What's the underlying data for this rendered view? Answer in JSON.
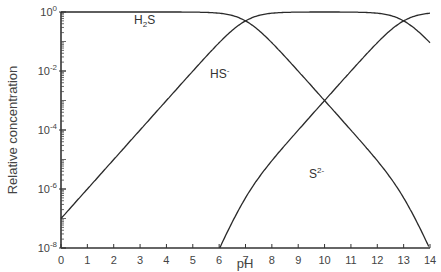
{
  "chart_data": {
    "type": "line",
    "title": "",
    "xlabel": "pH",
    "ylabel": "Relative concentration",
    "xlim": [
      0,
      14
    ],
    "ylim_log10": [
      -8,
      0
    ],
    "yscale": "log",
    "grid": false,
    "legend": "inline labels",
    "x_ticks": [
      "0",
      "1",
      "2",
      "3",
      "4",
      "5",
      "6",
      "7",
      "8",
      "9",
      "10",
      "11",
      "12",
      "13",
      "14"
    ],
    "y_ticks": [
      {
        "base": "10",
        "exp": "0",
        "log": 0
      },
      {
        "base": "10",
        "exp": "-2",
        "log": -2
      },
      {
        "base": "10",
        "exp": "-4",
        "log": -4
      },
      {
        "base": "10",
        "exp": "-6",
        "log": -6
      },
      {
        "base": "10",
        "exp": "-8",
        "log": -8
      }
    ],
    "pKa1": 7,
    "pKa2": 13,
    "series": [
      {
        "name": "H2S",
        "label_main": "H",
        "label_sub": "2",
        "label_end": "S",
        "label_sup": "",
        "x": [
          0,
          1,
          2,
          3,
          4,
          5,
          6,
          7,
          8,
          9,
          10,
          11,
          12,
          13,
          14
        ],
        "log10_values": [
          0,
          0,
          0,
          0,
          0,
          -0.04,
          -0.3,
          -1.0,
          -2.0,
          -3.0,
          -4.0,
          -5.0,
          -6.0,
          -7.0,
          -7.8
        ]
      },
      {
        "name": "HS-",
        "label_main": "HS",
        "label_sub": "",
        "label_end": "",
        "label_sup": "-",
        "x": [
          0,
          1,
          2,
          3,
          4,
          5,
          6,
          7,
          8,
          9,
          10,
          11,
          12,
          13,
          14
        ],
        "log10_values": [
          -7.0,
          -6.0,
          -5.0,
          -4.0,
          -3.0,
          -2.0,
          -1.04,
          -0.3,
          -0.04,
          0,
          0,
          0,
          -0.04,
          -0.3,
          -1.0
        ]
      },
      {
        "name": "S2-",
        "label_main": "S",
        "label_sub": "",
        "label_end": "",
        "label_sup": "2-",
        "x": [
          6,
          6.2,
          6.5,
          7,
          8,
          9,
          10,
          11,
          12,
          13,
          14
        ],
        "log10_values": [
          -8,
          -7.1,
          -6.2,
          -5.3,
          -4.1,
          -3.0,
          -2.0,
          -1.05,
          -0.3,
          -0.04,
          0
        ]
      }
    ]
  }
}
